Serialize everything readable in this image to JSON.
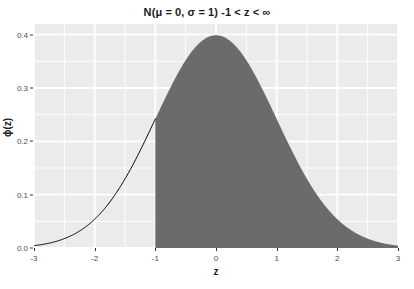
{
  "chart_data": {
    "type": "area",
    "title": "N(μ = 0, σ = 1) -1 < z < ∞",
    "xlabel": "z",
    "ylabel": "ϕ(z)",
    "xlim": [
      -3,
      3
    ],
    "ylim": [
      0,
      0.42
    ],
    "grid": true,
    "legend": "none",
    "distribution": {
      "name": "standard normal",
      "mu": 0,
      "sigma": 1,
      "formula": "phi(z) = exp(-z^2/2)/sqrt(2*pi)"
    },
    "shaded_region": {
      "label": "-1 < z < ∞",
      "from": -1,
      "to": 3,
      "fill_color": "#6b6b6b",
      "area_probability": 0.8413
    },
    "curve": {
      "line_color": "#000000",
      "line_width": 1,
      "drawn_range": [
        -3,
        -1
      ]
    },
    "x_ticks": [
      {
        "value": -3,
        "label": "-3"
      },
      {
        "value": -2,
        "label": "-2"
      },
      {
        "value": -1,
        "label": "-1"
      },
      {
        "value": 0,
        "label": "0"
      },
      {
        "value": 1,
        "label": "1"
      },
      {
        "value": 2,
        "label": "2"
      },
      {
        "value": 3,
        "label": "3"
      }
    ],
    "x_minor_ticks": [
      -2.5,
      -1.5,
      -0.5,
      0.5,
      1.5,
      2.5
    ],
    "y_ticks": [
      {
        "value": 0.0,
        "label": "0.0"
      },
      {
        "value": 0.1,
        "label": "0.1"
      },
      {
        "value": 0.2,
        "label": "0.2"
      },
      {
        "value": 0.3,
        "label": "0.3"
      },
      {
        "value": 0.4,
        "label": "0.4"
      }
    ],
    "y_minor_ticks": [
      0.05,
      0.15,
      0.25,
      0.35
    ],
    "x": [
      -3.0,
      -2.9,
      -2.8,
      -2.7,
      -2.6,
      -2.5,
      -2.4,
      -2.3,
      -2.2,
      -2.1,
      -2.0,
      -1.9,
      -1.8,
      -1.7,
      -1.6,
      -1.5,
      -1.4,
      -1.3,
      -1.2,
      -1.1,
      -1.0,
      -0.9,
      -0.8,
      -0.7,
      -0.6,
      -0.5,
      -0.4,
      -0.3,
      -0.2,
      -0.1,
      0.0,
      0.1,
      0.2,
      0.3,
      0.4,
      0.5,
      0.6,
      0.7,
      0.8,
      0.9,
      1.0,
      1.1,
      1.2,
      1.3,
      1.4,
      1.5,
      1.6,
      1.7,
      1.8,
      1.9,
      2.0,
      2.1,
      2.2,
      2.3,
      2.4,
      2.5,
      2.6,
      2.7,
      2.8,
      2.9,
      3.0
    ],
    "values": [
      0.0044,
      0.006,
      0.0079,
      0.0104,
      0.0136,
      0.0175,
      0.0224,
      0.0283,
      0.0355,
      0.044,
      0.054,
      0.0656,
      0.079,
      0.094,
      0.1109,
      0.1295,
      0.1497,
      0.1714,
      0.1942,
      0.2179,
      0.242,
      0.2661,
      0.2897,
      0.3123,
      0.3332,
      0.3521,
      0.3683,
      0.3814,
      0.391,
      0.397,
      0.3989,
      0.397,
      0.391,
      0.3814,
      0.3683,
      0.3521,
      0.3332,
      0.3123,
      0.2897,
      0.2661,
      0.242,
      0.2179,
      0.1942,
      0.1714,
      0.1497,
      0.1295,
      0.1109,
      0.094,
      0.079,
      0.0656,
      0.054,
      0.044,
      0.0355,
      0.0283,
      0.0224,
      0.0175,
      0.0136,
      0.0104,
      0.0079,
      0.006,
      0.0044
    ],
    "peak": {
      "x": 0,
      "y": 0.3989
    },
    "panel_background": "#ebebeb",
    "gridline_color": "#ffffff"
  },
  "title": "N(μ = 0, σ = 1) -1 < z < ∞",
  "axes": {
    "x_title": "z",
    "y_title": "ϕ(z)"
  },
  "ghost": {
    "text": ""
  }
}
